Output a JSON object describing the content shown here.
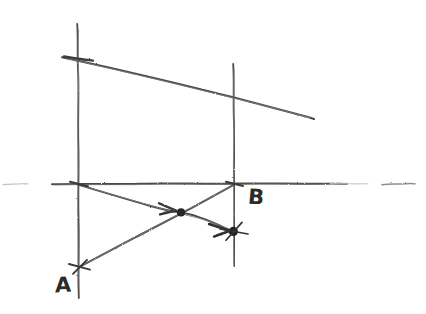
{
  "diagram": {
    "medium": "pencil sketch on white paper",
    "background_color": "#ffffff",
    "stroke_color": "#3a3a3a",
    "faint_stroke_color": "#b9b9b9",
    "width": 426,
    "height": 314,
    "labels": [
      {
        "name": "label-a",
        "text": "A",
        "x": 55,
        "y": 275
      },
      {
        "name": "label-b",
        "text": "B",
        "x": 248,
        "y": 187
      }
    ],
    "axis": {
      "name": "horizontal-axis",
      "y": 184,
      "main_segment": {
        "x1": 52,
        "x2": 347
      },
      "left_dash": {
        "x1": 3,
        "x2": 28
      },
      "right_dash": {
        "x1": 382,
        "x2": 415
      }
    },
    "vertical_lines": [
      {
        "name": "vertical-line-a",
        "x": 78,
        "y1": 24,
        "y2": 298
      },
      {
        "name": "vertical-line-b",
        "x": 234,
        "y1": 64,
        "y2": 266
      }
    ],
    "slanted_line": {
      "name": "upper-slanted-line",
      "x1": 62,
      "y1": 57,
      "x2": 314,
      "y2": 119,
      "crosses_line_b_at_y": 97
    },
    "vectors": [
      {
        "name": "vector-a-to-b",
        "from_label": "A",
        "x1": 78,
        "y1": 184,
        "x2": 234,
        "y2": 232,
        "arrow_at_x": 172,
        "arrow_at_y": 210,
        "dot_x": 181,
        "dot_y": 212
      },
      {
        "name": "vector-lower-a-to-b",
        "from_label": "A",
        "x1": 79,
        "y1": 267,
        "x2": 234,
        "y2": 184,
        "arrow_at_x": 222,
        "arrow_at_y": 228,
        "dot_x": 233,
        "dot_y": 231
      }
    ],
    "markers": [
      {
        "name": "point-marker-intersection",
        "x": 181,
        "y": 212,
        "kind": "filled-dot"
      },
      {
        "name": "point-marker-on-line-b",
        "x": 233,
        "y": 231,
        "kind": "filled-dot-with-cross"
      },
      {
        "name": "point-marker-a-lower",
        "x": 79,
        "y": 267,
        "kind": "cross-tick"
      },
      {
        "name": "point-marker-a-origin",
        "x": 78,
        "y": 184,
        "kind": "cross-tick"
      },
      {
        "name": "point-marker-b-origin",
        "x": 234,
        "y": 184,
        "kind": "cross-tick"
      },
      {
        "name": "point-marker-a-top",
        "x": 70,
        "y": 58,
        "kind": "cross-tick"
      }
    ]
  }
}
